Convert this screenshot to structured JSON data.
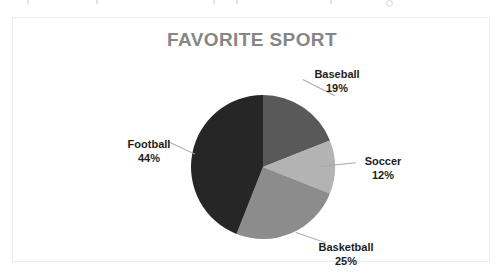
{
  "chart_data": {
    "type": "pie",
    "title": "FAVORITE SPORT",
    "categories": [
      "Baseball",
      "Soccer",
      "Basketball",
      "Football"
    ],
    "values": [
      19,
      12,
      25,
      44
    ],
    "value_labels": [
      "19%",
      "12%",
      "25%",
      "44%"
    ],
    "unit": "%",
    "legend": "none",
    "labels_position": "outside-with-leader-lines",
    "start_angle_deg": 0,
    "direction": "clockwise",
    "slice_colors": [
      "#595959",
      "#b3b3b3",
      "#8c8c8c",
      "#262626"
    ],
    "series": [
      {
        "name": "Favorite Sport",
        "values": [
          19,
          12,
          25,
          44
        ]
      }
    ],
    "xlabel": "",
    "ylabel": ""
  },
  "chart": {
    "title": "FAVORITE SPORT",
    "title_color": "#868686",
    "background_color": "#ffffff",
    "border_color": "#ececed",
    "slices": [
      {
        "label": "Baseball",
        "percent_label": "19%",
        "value": 19,
        "color": "#595959"
      },
      {
        "label": "Soccer",
        "percent_label": "12%",
        "value": 12,
        "color": "#b3b3b3"
      },
      {
        "label": "Basketball",
        "percent_label": "25%",
        "value": 25,
        "color": "#8c8c8c"
      },
      {
        "label": "Football",
        "percent_label": "44%",
        "value": 44,
        "color": "#262626"
      }
    ]
  }
}
